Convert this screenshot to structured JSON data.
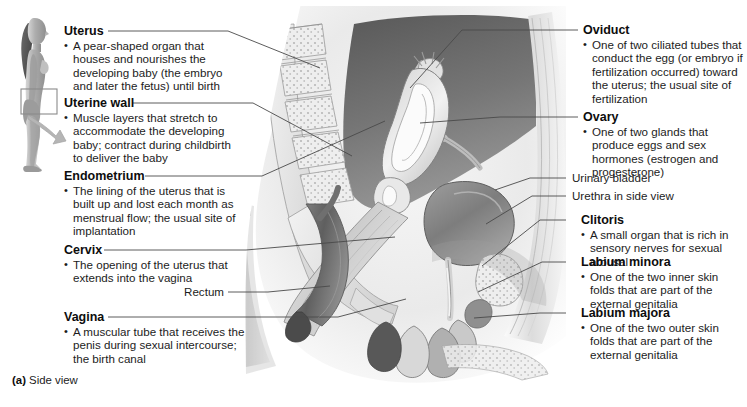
{
  "figure": {
    "caption_tag": "(a)",
    "caption_text": "Side view"
  },
  "inset": {
    "name": "standing-female-body-figure",
    "highlight_region": "pelvic region",
    "arrow_direction": "right"
  },
  "left_callouts": [
    {
      "term": "Uterus",
      "description": "A pear-shaped organ that houses and nourishes the developing baby (the embryo and later the fetus) until birth"
    },
    {
      "term": "Uterine wall",
      "description": "Muscle layers that stretch to accommodate the developing baby; contract during childbirth to deliver the baby"
    },
    {
      "term": "Endometrium",
      "description": "The lining of the uterus that is built up and lost each month as menstrual flow; the usual site of implantation"
    },
    {
      "term": "Cervix",
      "description": "The opening of the uterus that extends into the vagina"
    },
    {
      "term": "Vagina",
      "description": "A muscular tube that receives the penis during sexual intercourse; the birth canal"
    }
  ],
  "left_plain_labels": [
    {
      "text": "Rectum"
    }
  ],
  "right_callouts": [
    {
      "term": "Oviduct",
      "description": "One of two ciliated tubes that conduct the egg (or embryo if fertilization occurred) toward the uterus; the usual site of fertilization"
    },
    {
      "term": "Ovary",
      "description": "One of two glands that produce eggs and sex hormones (estrogen and progesterone)"
    },
    {
      "term": "Clitoris",
      "description": "A small organ that is rich in sensory nerves for sexual arousal"
    },
    {
      "term": "Labium minora",
      "description": "One of the two inner skin folds that are part of the external genitalia"
    },
    {
      "term": "Labium majora",
      "description": "One of the two outer skin folds that are part of the external genitalia"
    }
  ],
  "right_plain_labels": [
    {
      "text": "Urinary bladder"
    },
    {
      "text": "Urethra in side view"
    }
  ],
  "colors": {
    "background": "#ffffff",
    "text": "#1c1c1c",
    "term_text": "#0d0d0d",
    "leader_line": "#4a4a4a",
    "illustration_light": "#e9e9e9",
    "illustration_mid": "#b4b4b4",
    "illustration_dark": "#6e6e6e",
    "illustration_darkest": "#3d3d3d",
    "inset_skin": "#b9b9b9",
    "inset_arrow": "#b0b0b0"
  }
}
